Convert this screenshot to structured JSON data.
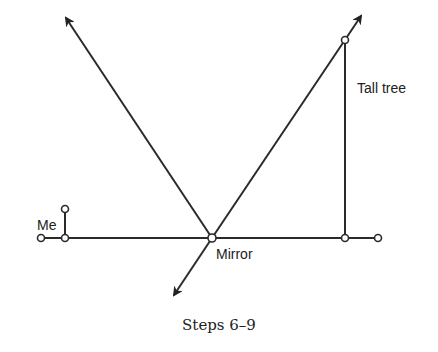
{
  "diagram": {
    "labels": {
      "me": "Me",
      "mirror": "Mirror",
      "tree": "Tall tree"
    },
    "caption": "Steps 6–9",
    "colors": {
      "line": "#2a2a2a",
      "background": "#ffffff"
    }
  }
}
